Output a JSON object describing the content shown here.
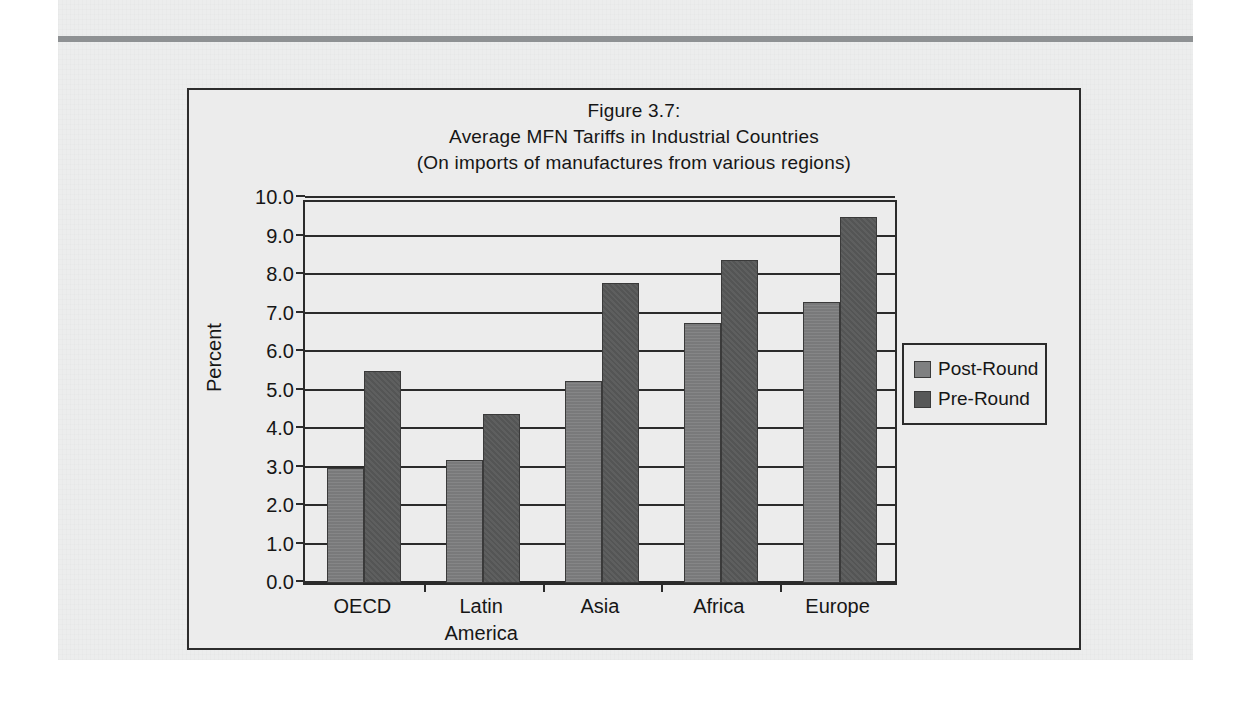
{
  "figure": {
    "title_lines": [
      "Figure 3.7:",
      "Average MFN Tariffs in Industrial Countries",
      "(On imports of manufactures from various regions)"
    ]
  },
  "chart_data": {
    "type": "bar",
    "title": "Figure 3.7: Average MFN Tariffs in Industrial Countries (On imports of manufactures from various regions)",
    "xlabel": "",
    "ylabel": "Percent",
    "ylim": [
      0.0,
      10.0
    ],
    "ytick_step": 1.0,
    "ytick_labels": [
      "0.0",
      "1.0",
      "2.0",
      "3.0",
      "4.0",
      "5.0",
      "6.0",
      "7.0",
      "8.0",
      "9.0",
      "10.0"
    ],
    "grid": true,
    "legend_position": "right",
    "categories": [
      "OECD",
      "Latin America",
      "Asia",
      "Africa",
      "Europe"
    ],
    "category_label_lines": [
      [
        "OECD"
      ],
      [
        "Latin",
        "America"
      ],
      [
        "Asia"
      ],
      [
        "Africa"
      ],
      [
        "Europe"
      ]
    ],
    "series": [
      {
        "name": "Post-Round",
        "color": "#7f8081",
        "values": [
          3.0,
          3.2,
          5.25,
          6.75,
          7.3
        ]
      },
      {
        "name": "Pre-Round",
        "color": "#575858",
        "values": [
          5.5,
          4.4,
          7.8,
          8.4,
          9.5
        ]
      }
    ]
  },
  "colors": {
    "page_background": "#eceded",
    "frame_border": "#2d2d2d",
    "top_rule": "#8e9193",
    "text": "#161616"
  }
}
